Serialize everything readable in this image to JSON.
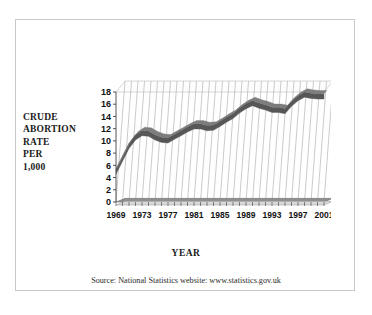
{
  "chart_data": {
    "type": "line",
    "title": "",
    "xlabel": "YEAR",
    "ylabel": "CRUDE ABORTION RATE PER 1,000",
    "ylabel_lines": [
      "CRUDE",
      "ABORTION",
      "RATE",
      "PER",
      "1,000"
    ],
    "ylim": [
      0,
      18
    ],
    "yticks": [
      0,
      2,
      4,
      6,
      8,
      10,
      12,
      14,
      16,
      18
    ],
    "xlim": [
      1969,
      2001
    ],
    "xticks": [
      1969,
      1973,
      1977,
      1981,
      1985,
      1989,
      1993,
      1997,
      2001
    ],
    "grid": "vertical-per-year",
    "legend": "none",
    "style": "3d-ribbon-line",
    "series": [
      {
        "name": "Crude abortion rate per 1,000",
        "color": "#575757",
        "x": [
          1969,
          1970,
          1971,
          1972,
          1973,
          1974,
          1975,
          1976,
          1977,
          1978,
          1979,
          1980,
          1981,
          1982,
          1983,
          1984,
          1985,
          1986,
          1987,
          1988,
          1989,
          1990,
          1991,
          1992,
          1993,
          1994,
          1995,
          1996,
          1997,
          1998,
          1999,
          2000,
          2001
        ],
        "values": [
          5.4,
          7.5,
          9.6,
          11.0,
          11.7,
          11.6,
          11.0,
          10.6,
          10.5,
          11.1,
          11.7,
          12.3,
          12.8,
          12.8,
          12.5,
          12.6,
          13.2,
          13.9,
          14.5,
          15.4,
          16.1,
          16.6,
          16.2,
          15.9,
          15.5,
          15.5,
          15.3,
          16.5,
          17.4,
          18.0,
          17.8,
          17.7,
          17.7
        ]
      }
    ]
  },
  "source": {
    "text": "Source: National Statistics website: www.statistics.gov.uk"
  }
}
